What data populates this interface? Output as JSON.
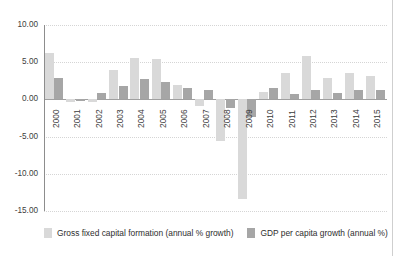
{
  "chart_data": {
    "type": "bar",
    "title": "",
    "subtitle": "",
    "xlabel": "",
    "ylabel": "",
    "ylim": [
      -15,
      10
    ],
    "yticks": [
      10,
      5,
      0,
      -5,
      -10,
      -15
    ],
    "ytick_labels": [
      "10.00",
      "5.00",
      "0.00",
      "-5.00",
      "-10.00",
      "-15.00"
    ],
    "grid": true,
    "legend_position": "bottom",
    "categories": [
      "2000",
      "2001",
      "2002",
      "2003",
      "2004",
      "2005",
      "2006",
      "2007",
      "2008",
      "2009",
      "2010",
      "2011",
      "2012",
      "2013",
      "2014",
      "2015"
    ],
    "series": [
      {
        "name": "Gross fixed capital formation (annual % growth)",
        "color": "#d9d9d9",
        "values": [
          6.3,
          -0.3,
          -0.4,
          3.9,
          5.6,
          5.4,
          2.0,
          -0.9,
          -5.6,
          -13.4,
          1.0,
          3.6,
          5.9,
          2.9,
          3.5,
          3.2
        ]
      },
      {
        "name": "GDP per capita growth (annual %)",
        "color": "#a6a6a6",
        "values": [
          2.9,
          -0.2,
          0.8,
          1.8,
          2.7,
          2.3,
          1.5,
          1.3,
          -1.2,
          -2.3,
          1.5,
          0.7,
          1.2,
          0.8,
          1.2,
          1.3
        ]
      }
    ]
  },
  "legend": {
    "items": [
      {
        "label": "Gross fixed capital formation (annual % growth)",
        "swatch": "light"
      },
      {
        "label": "GDP per capita growth (annual %)",
        "swatch": "dark"
      }
    ]
  }
}
